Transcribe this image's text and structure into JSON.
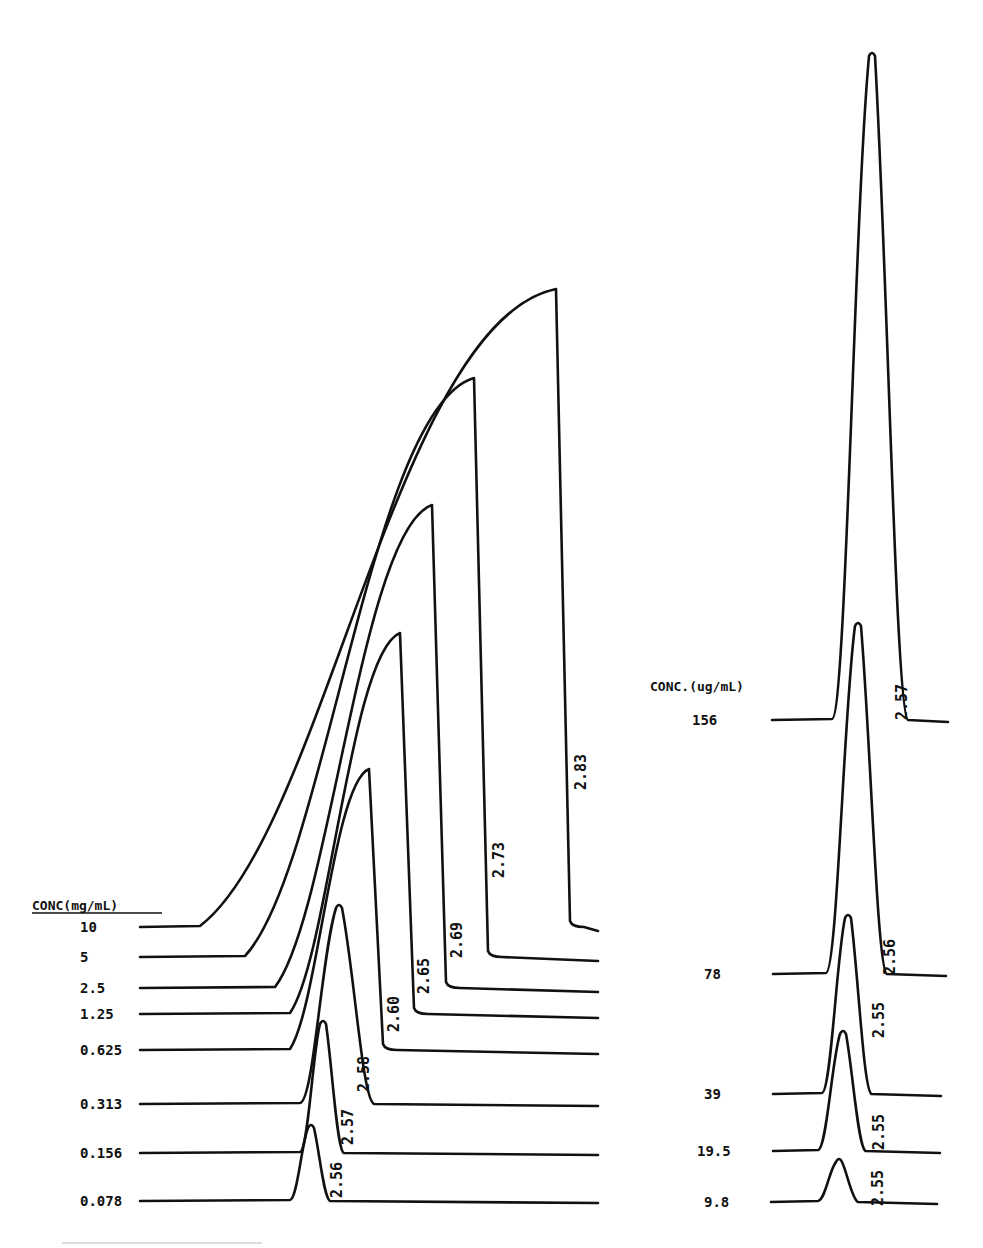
{
  "chart_data": [
    {
      "type": "line",
      "subtype": "stacked-chromatogram-overlay",
      "title": "",
      "legend_header": "CONC(mg/mL)",
      "xlabel": "",
      "ylabel": "",
      "grid": false,
      "series": [
        {
          "name": "10",
          "baseline_y": 927,
          "label_x": 80,
          "line_start_x": 140,
          "rise_start_x": 200,
          "peak_x": 556,
          "peak_y": 289,
          "end_x": 598,
          "retention_time": "2.83",
          "rt_label_x": 576,
          "rt_label_y": 760
        },
        {
          "name": "5",
          "baseline_y": 957,
          "label_x": 80,
          "line_start_x": 140,
          "rise_start_x": 245,
          "peak_x": 474,
          "peak_y": 378,
          "end_x": 598,
          "retention_time": "2.73",
          "rt_label_x": 494,
          "rt_label_y": 848
        },
        {
          "name": "2.5",
          "baseline_y": 988,
          "label_x": 80,
          "line_start_x": 140,
          "rise_start_x": 275,
          "peak_x": 432,
          "peak_y": 505,
          "end_x": 598,
          "retention_time": "2.69",
          "rt_label_x": 452,
          "rt_label_y": 928
        },
        {
          "name": "1.25",
          "baseline_y": 1014,
          "label_x": 80,
          "line_start_x": 140,
          "rise_start_x": 290,
          "peak_x": 400,
          "peak_y": 633,
          "end_x": 598,
          "retention_time": "2.65",
          "rt_label_x": 419,
          "rt_label_y": 964
        },
        {
          "name": "0.625",
          "baseline_y": 1050,
          "label_x": 80,
          "line_start_x": 140,
          "rise_start_x": 290,
          "peak_x": 369,
          "peak_y": 769,
          "end_x": 598,
          "retention_time": "2.60",
          "rt_label_x": 389,
          "rt_label_y": 1002
        },
        {
          "name": "0.313",
          "baseline_y": 1104,
          "label_x": 80,
          "line_start_x": 140,
          "rise_start_x": 300,
          "peak_x": 339,
          "peak_y": 904,
          "end_x": 598,
          "retention_time": "2.58",
          "rt_label_x": 359,
          "rt_label_y": 1062
        },
        {
          "name": "0.156",
          "baseline_y": 1153,
          "label_x": 80,
          "line_start_x": 140,
          "rise_start_x": 300,
          "peak_x": 323,
          "peak_y": 1020,
          "end_x": 598,
          "retention_time": "2.57",
          "rt_label_x": 343,
          "rt_label_y": 1115
        },
        {
          "name": "0.078",
          "baseline_y": 1201,
          "label_x": 80,
          "line_start_x": 140,
          "rise_start_x": 290,
          "peak_x": 311,
          "peak_y": 1124,
          "end_x": 598,
          "retention_time": "2.56",
          "rt_label_x": 332,
          "rt_label_y": 1168
        }
      ]
    },
    {
      "type": "line",
      "subtype": "stacked-chromatogram-overlay",
      "title": "",
      "legend_header": "CONC.(ug/mL)",
      "xlabel": "",
      "ylabel": "",
      "grid": false,
      "series": [
        {
          "name": "156",
          "baseline_y": 720,
          "label_x": 692,
          "line_start_x": 772,
          "rise_start_x": 832,
          "peak_x": 872,
          "peak_y": 52,
          "end_x": 948,
          "retention_time": "2.57",
          "rt_label_x": 897,
          "rt_label_y": 690
        },
        {
          "name": "78",
          "baseline_y": 974,
          "label_x": 704,
          "line_start_x": 773,
          "rise_start_x": 826,
          "peak_x": 858,
          "peak_y": 622,
          "end_x": 946,
          "retention_time": "2.56",
          "rt_label_x": 885,
          "rt_label_y": 945
        },
        {
          "name": "39",
          "baseline_y": 1094,
          "label_x": 704,
          "line_start_x": 773,
          "rise_start_x": 822,
          "peak_x": 848,
          "peak_y": 914,
          "end_x": 941,
          "retention_time": "2.55",
          "rt_label_x": 874,
          "rt_label_y": 1008
        },
        {
          "name": "19.5",
          "baseline_y": 1151,
          "label_x": 697,
          "line_start_x": 773,
          "rise_start_x": 818,
          "peak_x": 843,
          "peak_y": 1030,
          "end_x": 940,
          "retention_time": "2.55",
          "rt_label_x": 874,
          "rt_label_y": 1120
        },
        {
          "name": "9.8",
          "baseline_y": 1202,
          "label_x": 704,
          "line_start_x": 771,
          "rise_start_x": 818,
          "peak_x": 839,
          "peak_y": 1158,
          "end_x": 937,
          "retention_time": "2.55",
          "rt_label_x": 873,
          "rt_label_y": 1176
        }
      ]
    }
  ],
  "left_panel": {
    "header": "CONC(mg/mL)",
    "header_x": 32,
    "header_y": 910
  },
  "right_panel": {
    "header": "CONC.(ug/mL)",
    "header_x": 650,
    "header_y": 691
  },
  "colors": {
    "ink": "#111111",
    "background": "#ffffff"
  }
}
